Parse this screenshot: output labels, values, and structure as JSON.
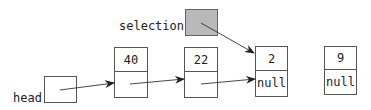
{
  "diagram": {
    "type": "linked-list",
    "labels": {
      "head": "head",
      "selection": "selection"
    },
    "nodes": [
      {
        "id": "n40",
        "value": "40",
        "next": ""
      },
      {
        "id": "n22",
        "value": "22",
        "next": ""
      },
      {
        "id": "n2",
        "value": "2",
        "next": "null"
      },
      {
        "id": "n9",
        "value": "9",
        "next": "null"
      }
    ],
    "edges": [
      {
        "from": "head",
        "to": "n40"
      },
      {
        "from": "n40",
        "to": "n22"
      },
      {
        "from": "n22",
        "to": "n2"
      },
      {
        "from": "selection",
        "to": "n2"
      }
    ],
    "colors": {
      "selection_fill": "#b9b9b9",
      "box_stroke": "#555555",
      "background": "#ffffff"
    }
  }
}
